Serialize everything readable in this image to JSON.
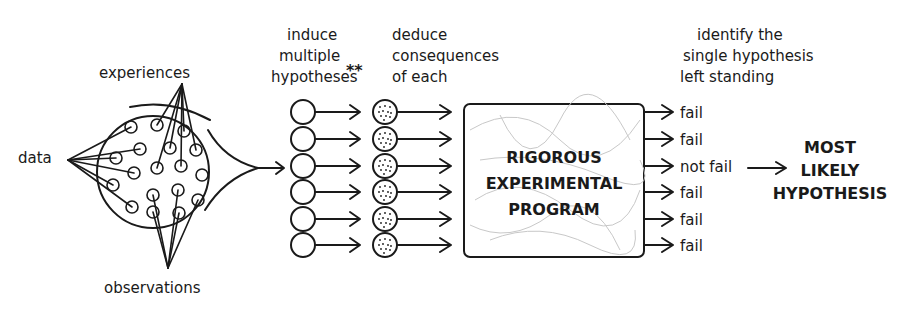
{
  "labels": {
    "data": "data",
    "experiences": "experiences",
    "observations": "observations",
    "induce": [
      "induce",
      "multiple",
      "hypotheses"
    ],
    "asterisks": "**",
    "deduce": [
      "deduce",
      "consequences",
      "of each"
    ],
    "identify": [
      "identify the",
      "single hypothesis",
      "left standing"
    ],
    "program": [
      "RIGOROUS",
      "EXPERIMENTAL",
      "PROGRAM"
    ],
    "result": [
      "MOST",
      "LIKELY",
      "HYPOTHESIS"
    ]
  },
  "outcomes": [
    "fail",
    "fail",
    "not fail",
    "fail",
    "fail",
    "fail"
  ],
  "hypothesis_count": 6
}
